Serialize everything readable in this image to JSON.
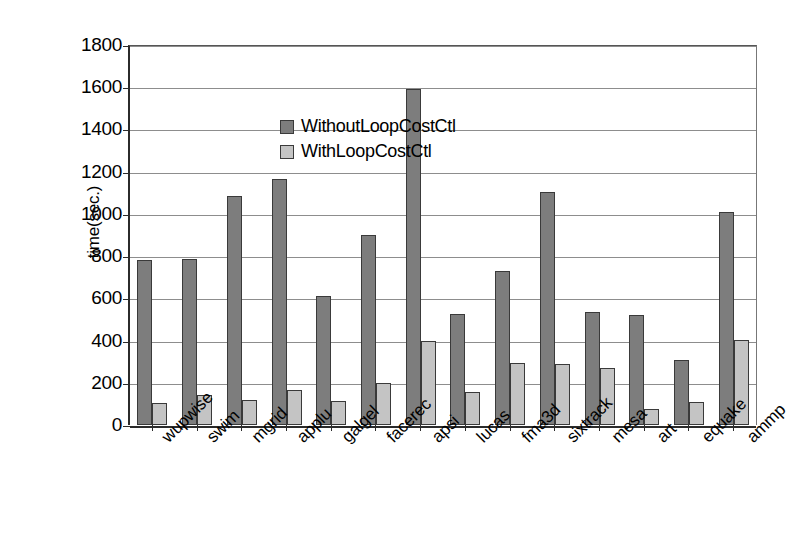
{
  "chart_data": {
    "type": "bar",
    "title": "",
    "xlabel": "",
    "ylabel": "time(sec.)",
    "ylim": [
      0,
      1800
    ],
    "ytick_step": 200,
    "yticks": [
      1800,
      1600,
      1400,
      1200,
      1000,
      800,
      600,
      400,
      200,
      0
    ],
    "grid": true,
    "legend_position": "top-left inside plot",
    "categories": [
      "wupwise",
      "swim",
      "mgrid",
      "applu",
      "galgel",
      "facerec",
      "apsi",
      "lucas",
      "fma3d",
      "sixtrack",
      "mesa",
      "art",
      "equake",
      "ammp"
    ],
    "series": [
      {
        "name": "WithoutLoopCostCtl",
        "color": "#7d7d7d",
        "values": [
          780,
          785,
          1085,
          1165,
          610,
          900,
          1590,
          525,
          730,
          1105,
          535,
          520,
          310,
          1010
        ]
      },
      {
        "name": "WithLoopCostCtl",
        "color": "#c4c4c4",
        "values": [
          105,
          140,
          120,
          165,
          115,
          200,
          400,
          155,
          295,
          290,
          270,
          75,
          110,
          405
        ]
      }
    ]
  },
  "axis": {
    "y_title": "time(sec.)"
  },
  "legend": {
    "items": [
      {
        "label": "WithoutLoopCostCtl",
        "color": "#7d7d7d"
      },
      {
        "label": "WithLoopCostCtl",
        "color": "#c4c4c4"
      }
    ]
  },
  "colors": {
    "series_without": "#7d7d7d",
    "series_with": "#c4c4c4",
    "axis": "#2b2b2b",
    "grid": "#8d8d8d",
    "background": "#ffffff"
  }
}
